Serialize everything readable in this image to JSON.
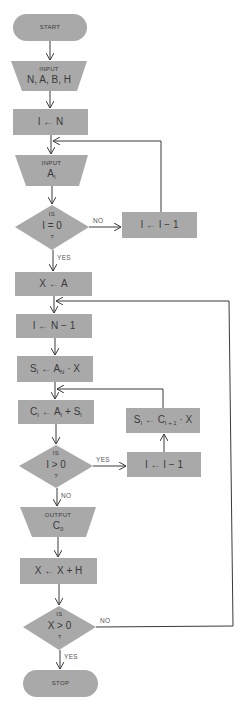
{
  "colors": {
    "node_fill": "#a9a9a9",
    "line": "#3a3a3a",
    "text": "#3a3a3a",
    "background": "#ffffff"
  },
  "nodes": {
    "start": {
      "shape": "terminal",
      "label": "START"
    },
    "input_params": {
      "shape": "input",
      "caption": "INPUT",
      "label": "N, A, B, H"
    },
    "init_i": {
      "shape": "process",
      "label": "I ← N"
    },
    "input_a": {
      "shape": "input",
      "caption": "INPUT",
      "label_main": "A",
      "label_sub": "I"
    },
    "decision_i_zero": {
      "shape": "decision",
      "top": "IS",
      "label": "I = 0",
      "bottom": "?"
    },
    "decrement_i_1": {
      "shape": "process",
      "label": "I ← I − 1"
    },
    "set_x": {
      "shape": "process",
      "label": "X ← A"
    },
    "set_i_n_minus_1": {
      "shape": "process",
      "label": "I ← N − 1"
    },
    "compute_s_initial": {
      "shape": "process",
      "s": "S",
      "s_sub": "I",
      "arrow": "←",
      "a": "A",
      "a_sub": "N",
      "tail": "· X"
    },
    "compute_c": {
      "shape": "process",
      "c": "C",
      "c_sub": "I",
      "arrow": "←",
      "a": "A",
      "a_sub": "I",
      "plus": "+",
      "s": "S",
      "s_sub": "I"
    },
    "compute_s_loop": {
      "shape": "process",
      "s": "S",
      "s_sub": "I",
      "arrow": "←",
      "c": "C",
      "c_sub": "I + 1",
      "tail": "· X"
    },
    "decision_i_positive": {
      "shape": "decision",
      "top": "IS",
      "label": "I > 0",
      "bottom": "?"
    },
    "decrement_i_2": {
      "shape": "process",
      "label": "I ← I − 1"
    },
    "output_c": {
      "shape": "output",
      "caption": "OUTPUT",
      "label_main": "C",
      "label_sub": "0"
    },
    "increment_x": {
      "shape": "process",
      "label": "X ← X + H"
    },
    "decision_x_positive": {
      "shape": "decision",
      "top": "IS",
      "label": "X > 0",
      "bottom": "?"
    },
    "stop": {
      "shape": "terminal",
      "label": "STOP"
    }
  },
  "edges": {
    "i_zero_no": "NO",
    "i_zero_yes": "YES",
    "i_positive_yes": "YES",
    "i_positive_no": "NO",
    "x_positive_no": "NO",
    "x_positive_yes": "YES"
  }
}
